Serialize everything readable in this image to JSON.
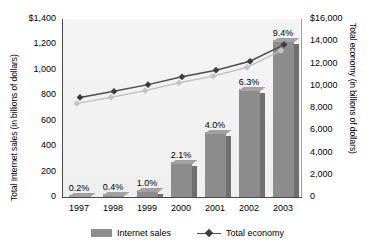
{
  "chart_data": {
    "type": "bar",
    "title": "",
    "categories": [
      "1997",
      "1998",
      "1999",
      "2000",
      "2001",
      "2002",
      "2003"
    ],
    "series": [
      {
        "name": "Internet sales",
        "type": "bar",
        "axis": "left",
        "values": [
          6,
          16,
          50,
          265,
          500,
          840,
          1230
        ],
        "point_labels": [
          "0.2%",
          "0.4%",
          "1.0%",
          "2.1%",
          "4.0%",
          "6.3%",
          "9.4%"
        ],
        "color": "#8c8c8c"
      },
      {
        "name": "Total economy",
        "type": "line",
        "axis": "right",
        "values": [
          8950,
          9500,
          10100,
          10800,
          11400,
          12200,
          13700
        ],
        "color": "#4c4c4c",
        "marker": "diamond"
      }
    ],
    "xlabel": "",
    "ylabel": "Total Internet sales (in billions of dollars)",
    "y2label": "Total economy (in billions of dollars)",
    "ylim": [
      0,
      1400
    ],
    "y2lim": [
      0,
      16000
    ],
    "yticks": [
      "$1,400",
      "1,200",
      "1,000",
      "800",
      "600",
      "400",
      "200",
      "0"
    ],
    "ytick_values": [
      1400,
      1200,
      1000,
      800,
      600,
      400,
      200,
      0
    ],
    "y2ticks": [
      "$16,000",
      "14,000",
      "12,000",
      "10,000",
      "8,000",
      "6,000",
      "4,000",
      "2,000",
      "0"
    ],
    "y2tick_values": [
      16000,
      14000,
      12000,
      10000,
      8000,
      6000,
      4000,
      2000,
      0
    ],
    "grid": false,
    "legend_position": "bottom"
  },
  "legend": {
    "bar_label": "Internet sales",
    "line_label": "Total economy"
  }
}
